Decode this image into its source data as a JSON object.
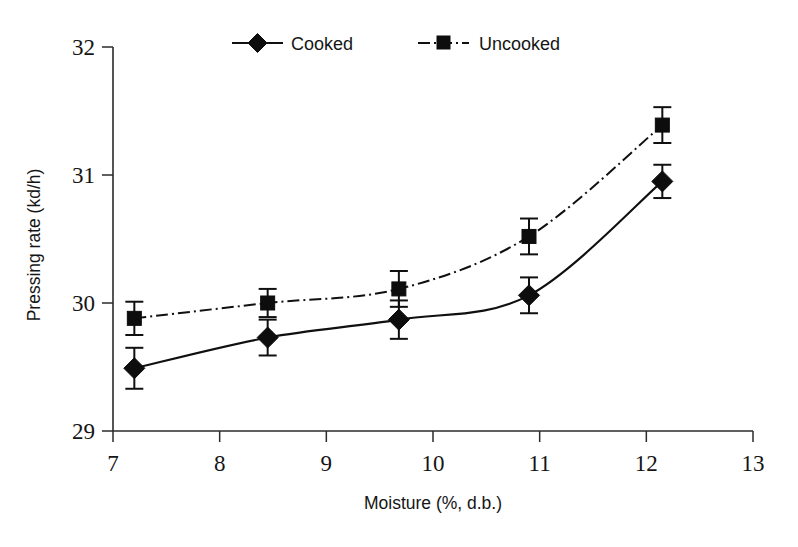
{
  "chart_data": {
    "type": "line",
    "title": "",
    "xlabel": "Moisture (%, d.b.)",
    "ylabel": "Pressing rate (kd/h)",
    "xlim": [
      7,
      13
    ],
    "ylim": [
      29,
      32
    ],
    "xticks": [
      7,
      8,
      9,
      10,
      11,
      12,
      13
    ],
    "yticks": [
      29,
      30,
      31,
      32
    ],
    "xtick_labels": [
      "7",
      "8",
      "9",
      "10",
      "11",
      "12",
      "13"
    ],
    "ytick_labels": [
      "29",
      "30",
      "31",
      "32"
    ],
    "grid": false,
    "legend_position": "top-center",
    "x": [
      7.2,
      8.45,
      9.68,
      10.9,
      12.15
    ],
    "series": [
      {
        "name": "Cooked",
        "marker": "diamond",
        "linestyle": "solid",
        "color": "#0d0d0d",
        "values": [
          29.49,
          29.73,
          29.87,
          30.06,
          30.95
        ],
        "errors": [
          0.16,
          0.14,
          0.15,
          0.14,
          0.13
        ]
      },
      {
        "name": "Uncooked",
        "marker": "square",
        "linestyle": "dash-dot",
        "color": "#0d0d0d",
        "values": [
          29.88,
          30.0,
          30.11,
          30.52,
          31.39
        ],
        "errors": [
          0.13,
          0.11,
          0.14,
          0.14,
          0.14
        ]
      }
    ]
  },
  "legend": {
    "entries": [
      {
        "label": "Cooked"
      },
      {
        "label": "Uncooked"
      }
    ]
  },
  "axes": {
    "x_title": "Moisture (%, d.b.)",
    "y_title": "Pressing rate (kd/h)"
  }
}
